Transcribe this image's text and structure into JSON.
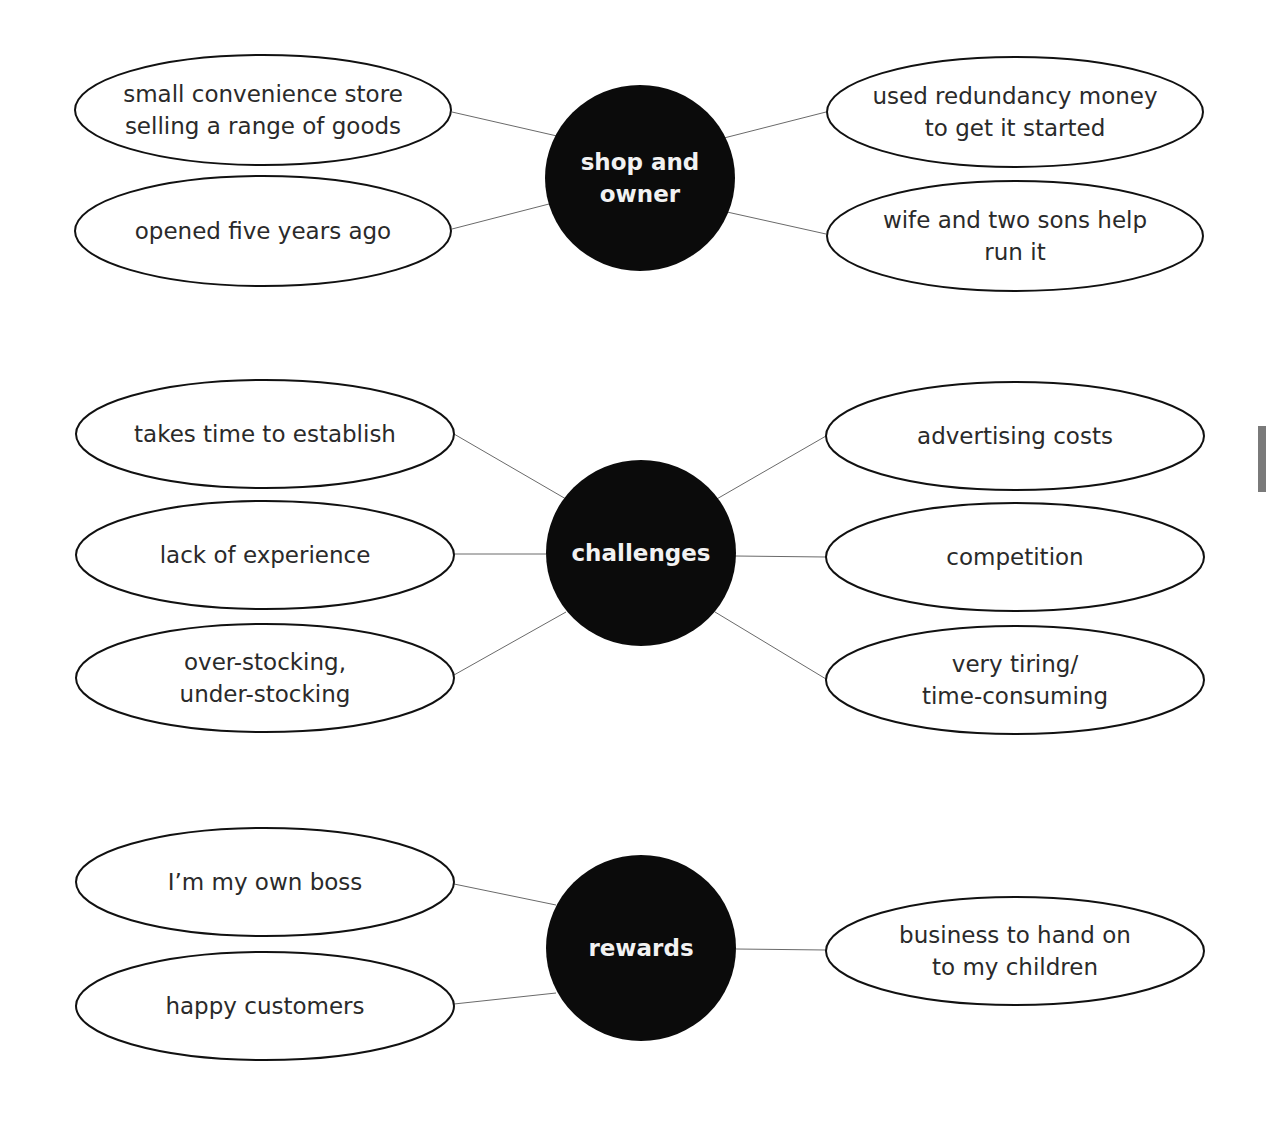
{
  "diagram": {
    "colors": {
      "hub": "#0b0b0b",
      "hub_text": "#f2f2f2",
      "leaf_border": "#111111",
      "leaf_text": "#2a2a2a",
      "link": "#6a6a6a",
      "side_tab": "#7a7a7a"
    },
    "groups": [
      {
        "id": "shop-and-owner",
        "hub": {
          "lines": [
            "shop and",
            "owner"
          ],
          "cx": 640,
          "cy": 178,
          "rx": 95,
          "ry": 93
        },
        "leaves": [
          {
            "lines": [
              "small convenience store",
              "selling a range of goods"
            ],
            "cx": 263,
            "cy": 110,
            "rx": 188,
            "ry": 55,
            "link": [
              452,
              112,
              557,
              136
            ]
          },
          {
            "lines": [
              "opened five years ago"
            ],
            "cx": 263,
            "cy": 231,
            "rx": 188,
            "ry": 55,
            "link": [
              452,
              229,
              549,
              204
            ]
          },
          {
            "lines": [
              "used redundancy money",
              "to get it started"
            ],
            "cx": 1015,
            "cy": 112,
            "rx": 188,
            "ry": 55,
            "link": [
              724,
              138,
              826,
              112
            ]
          },
          {
            "lines": [
              "wife and two sons help",
              "run it"
            ],
            "cx": 1015,
            "cy": 236,
            "rx": 188,
            "ry": 55,
            "link": [
              727,
              212,
              826,
              234
            ]
          }
        ]
      },
      {
        "id": "challenges",
        "hub": {
          "lines": [
            "challenges"
          ],
          "cx": 641,
          "cy": 553,
          "rx": 95,
          "ry": 93
        },
        "leaves": [
          {
            "lines": [
              "takes time to establish"
            ],
            "cx": 265,
            "cy": 434,
            "rx": 189,
            "ry": 54,
            "link": [
              454,
              434,
              566,
              499
            ]
          },
          {
            "lines": [
              "lack of experience"
            ],
            "cx": 265,
            "cy": 555,
            "rx": 189,
            "ry": 54,
            "link": [
              454,
              554,
              546,
              554
            ]
          },
          {
            "lines": [
              "over-stocking,",
              "under-stocking"
            ],
            "cx": 265,
            "cy": 678,
            "rx": 189,
            "ry": 54,
            "link": [
              454,
              675,
              566,
              612
            ]
          },
          {
            "lines": [
              "advertising costs"
            ],
            "cx": 1015,
            "cy": 436,
            "rx": 189,
            "ry": 54,
            "link": [
              715,
              500,
              826,
              436
            ]
          },
          {
            "lines": [
              "competition"
            ],
            "cx": 1015,
            "cy": 557,
            "rx": 189,
            "ry": 54,
            "link": [
              735,
              556,
              826,
              557
            ]
          },
          {
            "lines": [
              "very tiring/",
              "time-consuming"
            ],
            "cx": 1015,
            "cy": 680,
            "rx": 189,
            "ry": 54,
            "link": [
              715,
              612,
              826,
              679
            ]
          }
        ]
      },
      {
        "id": "rewards",
        "hub": {
          "lines": [
            "rewards"
          ],
          "cx": 641,
          "cy": 948,
          "rx": 95,
          "ry": 93
        },
        "leaves": [
          {
            "lines": [
              "I’m my own boss"
            ],
            "cx": 265,
            "cy": 882,
            "rx": 189,
            "ry": 54,
            "link": [
              454,
              884,
              556,
              905
            ]
          },
          {
            "lines": [
              "happy customers"
            ],
            "cx": 265,
            "cy": 1006,
            "rx": 189,
            "ry": 54,
            "link": [
              454,
              1004,
              556,
              993
            ]
          },
          {
            "lines": [
              "business to hand on",
              "to my children"
            ],
            "cx": 1015,
            "cy": 951,
            "rx": 189,
            "ry": 54,
            "link": [
              736,
              949,
              826,
              950
            ]
          }
        ]
      }
    ]
  }
}
